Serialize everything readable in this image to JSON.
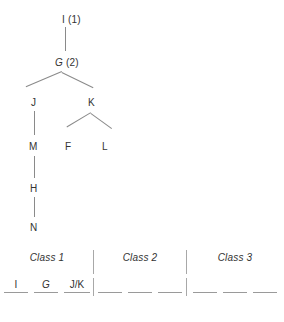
{
  "figure": {
    "line_color": "#8a8a8a",
    "text_color": "#333333",
    "background": "#ffffff"
  },
  "tree": {
    "nodes": [
      {
        "id": "I",
        "label": "I",
        "number": "(1)",
        "italic": false,
        "x": 62,
        "y": 14
      },
      {
        "id": "G",
        "label": "G",
        "number": "(2)",
        "italic": true,
        "x": 55,
        "y": 57
      },
      {
        "id": "J",
        "label": "J",
        "number": "",
        "italic": false,
        "x": 31,
        "y": 97
      },
      {
        "id": "K",
        "label": "K",
        "number": "",
        "italic": false,
        "x": 88,
        "y": 97
      },
      {
        "id": "M",
        "label": "M",
        "number": "",
        "italic": false,
        "x": 29,
        "y": 141
      },
      {
        "id": "F",
        "label": "F",
        "number": "",
        "italic": false,
        "x": 65,
        "y": 141
      },
      {
        "id": "L",
        "label": "L",
        "number": "",
        "italic": false,
        "x": 102,
        "y": 141
      },
      {
        "id": "H",
        "label": "H",
        "number": "",
        "italic": false,
        "x": 30,
        "y": 183
      },
      {
        "id": "N",
        "label": "N",
        "number": "",
        "italic": false,
        "x": 30,
        "y": 222
      }
    ],
    "edges": [
      {
        "from": "I",
        "to": "G",
        "type": "vertical"
      },
      {
        "from": "G",
        "to": "J",
        "type": "diagonal"
      },
      {
        "from": "G",
        "to": "K",
        "type": "diagonal"
      },
      {
        "from": "J",
        "to": "M",
        "type": "vertical"
      },
      {
        "from": "K",
        "to": "F",
        "type": "diagonal"
      },
      {
        "from": "K",
        "to": "L",
        "type": "diagonal"
      },
      {
        "from": "M",
        "to": "H",
        "type": "vertical"
      },
      {
        "from": "H",
        "to": "N",
        "type": "vertical"
      }
    ]
  },
  "classes": {
    "columns": [
      {
        "title": "Class 1",
        "blanks": [
          {
            "value": "I",
            "italic": false
          },
          {
            "value": "G",
            "italic": true
          },
          {
            "value": "J/K",
            "italic": false
          }
        ]
      },
      {
        "title": "Class 2",
        "blanks": [
          {
            "value": "",
            "italic": false
          },
          {
            "value": "",
            "italic": false
          },
          {
            "value": "",
            "italic": false
          }
        ]
      },
      {
        "title": "Class 3",
        "blanks": [
          {
            "value": "",
            "italic": false
          },
          {
            "value": "",
            "italic": false
          },
          {
            "value": "",
            "italic": false
          }
        ]
      }
    ]
  }
}
